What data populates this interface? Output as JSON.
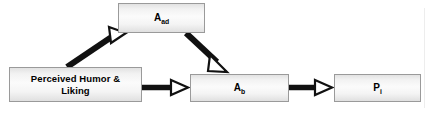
{
  "diagram": {
    "type": "conceptual-path-model",
    "title": "",
    "nodes": [
      {
        "id": "aad",
        "label": "A",
        "subscript": "ad",
        "full_text": "Aad",
        "shape": "rectangle",
        "x": 118,
        "y": 3,
        "width": 87,
        "height": 30
      },
      {
        "id": "humor",
        "label": "Perceived Humor &\nLiking",
        "subscript": "",
        "full_text": "Perceived Humor & Liking",
        "shape": "rectangle",
        "x": 9,
        "y": 67,
        "width": 133,
        "height": 35
      },
      {
        "id": "ab",
        "label": "A",
        "subscript": "b",
        "full_text": "Ab",
        "shape": "rectangle",
        "x": 190,
        "y": 74,
        "width": 99,
        "height": 28
      },
      {
        "id": "pi",
        "label": "P",
        "subscript": "i",
        "full_text": "Pi",
        "shape": "rectangle",
        "x": 334,
        "y": 74,
        "width": 87,
        "height": 28
      }
    ],
    "edges": [
      {
        "id": "humor-to-aad",
        "from": "humor",
        "to": "aad",
        "style": "solid-thick",
        "arrowhead": "hollow-triangle",
        "label": ""
      },
      {
        "id": "aad-to-ab",
        "from": "aad",
        "to": "ab",
        "style": "solid-thick",
        "arrowhead": "hollow-triangle",
        "label": ""
      },
      {
        "id": "humor-to-ab",
        "from": "humor",
        "to": "ab",
        "style": "solid-thick",
        "arrowhead": "hollow-triangle",
        "label": ""
      },
      {
        "id": "ab-to-pi",
        "from": "ab",
        "to": "pi",
        "style": "solid-thick",
        "arrowhead": "hollow-triangle",
        "label": ""
      }
    ],
    "colors": {
      "background": "#ffffff",
      "node_border": "#9a9a9a",
      "node_fill_light": "#fbfbfb",
      "node_fill_dark": "#e0e0e0",
      "edge": "#000000",
      "text": "#000000"
    }
  }
}
